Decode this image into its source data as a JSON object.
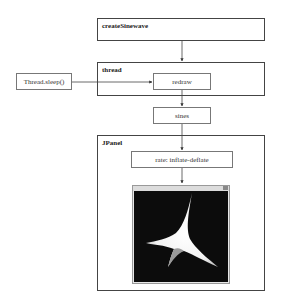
{
  "diagram": {
    "nodes": {
      "create_sinewave": {
        "label": "createSinewave"
      },
      "thread": {
        "label": "thread"
      },
      "thread_sleep": {
        "label": "Thread.sleep()"
      },
      "redraw": {
        "label": "redraw"
      },
      "sines": {
        "label": "sines"
      },
      "jpanel": {
        "label": "JPanel"
      },
      "rate": {
        "label": "rate: inflate-deflate"
      }
    },
    "edges": [
      {
        "from": "createSinewave",
        "to": "thread"
      },
      {
        "from": "Thread.sleep()",
        "to": "redraw"
      },
      {
        "from": "redraw",
        "to": "sines"
      },
      {
        "from": "sines",
        "to": "JPanel"
      },
      {
        "from": "rate: inflate-deflate",
        "to": "output-window"
      }
    ],
    "output_window": {
      "background": "#0c0c0c",
      "shape": "white four-pointed astroid-like star",
      "shape_color": "#ffffff"
    }
  }
}
